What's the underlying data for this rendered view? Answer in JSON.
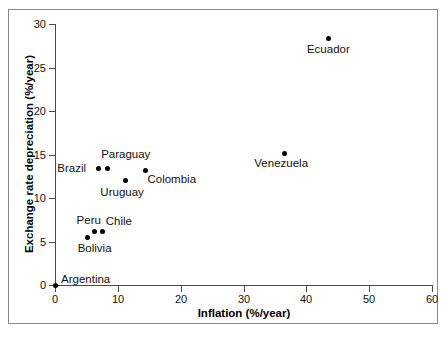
{
  "figure": {
    "background_color": "#ffffff",
    "frame_color": "#8a8a8a",
    "axis_color": "#4a4a4a",
    "marker_color": "#000000"
  },
  "chart_data": {
    "type": "scatter",
    "title": "",
    "xlabel": "Inflation (%/year)",
    "ylabel": "Exchange rate depreciation (%/year)",
    "xlim": [
      0,
      60
    ],
    "ylim": [
      0,
      30
    ],
    "xticks": [
      0,
      10,
      20,
      30,
      40,
      50,
      60
    ],
    "yticks": [
      0,
      5,
      10,
      15,
      20,
      25,
      30
    ],
    "xtick_labels": [
      "0",
      "10",
      "20",
      "30",
      "40",
      "50",
      "60"
    ],
    "ytick_labels": [
      "0",
      "5",
      "10",
      "15",
      "20",
      "25",
      "30"
    ],
    "grid": false,
    "legend": "none",
    "marker": "filled-circle",
    "points": [
      {
        "name": "Argentina",
        "x": 0.0,
        "y": 0.0,
        "label": "Argentina",
        "label_dx": 6,
        "label_dy": -12
      },
      {
        "name": "Bolivia",
        "x": 5.2,
        "y": 5.5,
        "label": "Bolivia",
        "label_dx": -10,
        "label_dy": 5
      },
      {
        "name": "Peru",
        "x": 6.3,
        "y": 6.1,
        "label": "Peru",
        "label_dx": -18,
        "label_dy": -18
      },
      {
        "name": "Chile",
        "x": 7.6,
        "y": 6.2,
        "label": "Chile",
        "label_dx": 3,
        "label_dy": -16
      },
      {
        "name": "Brazil",
        "x": 6.9,
        "y": 13.4,
        "label": "Brazil",
        "label_dx": -41,
        "label_dy": -6
      },
      {
        "name": "Paraguay",
        "x": 8.3,
        "y": 13.4,
        "label": "Paraguay",
        "label_dx": -6,
        "label_dy": -20
      },
      {
        "name": "Uruguay",
        "x": 11.2,
        "y": 12.0,
        "label": "Uruguay",
        "label_dx": -25,
        "label_dy": 5
      },
      {
        "name": "Colombia",
        "x": 14.4,
        "y": 13.2,
        "label": "Colombia",
        "label_dx": 2,
        "label_dy": 3
      },
      {
        "name": "Venezuela",
        "x": 36.5,
        "y": 15.1,
        "label": "Venezuela",
        "label_dx": -30,
        "label_dy": 3
      },
      {
        "name": "Ecuador",
        "x": 43.6,
        "y": 28.3,
        "label": "Ecuador",
        "label_dx": -22,
        "label_dy": 4
      }
    ]
  }
}
